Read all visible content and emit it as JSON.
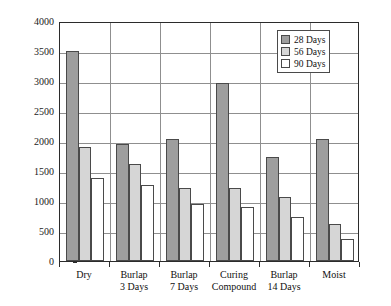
{
  "chart_data": {
    "type": "bar",
    "title": "",
    "xlabel": "",
    "ylabel": "Charge Passed in 6 h (coulomb)",
    "ylim": [
      0,
      4000
    ],
    "ytick_labels": [
      "0",
      "500",
      "1000",
      "1500",
      "2000",
      "2500",
      "3000",
      "3500",
      "4000"
    ],
    "ytick_values": [
      0,
      500,
      1000,
      1500,
      2000,
      2500,
      3000,
      3500,
      4000
    ],
    "grid": "horizontal-and-vertical",
    "legend_position": "top-right",
    "categories": [
      "Dry",
      "Burlap\n3 Days",
      "Burlap\n7 Days",
      "Curing\nCompound",
      "Burlap\n14 Days",
      "Moist"
    ],
    "series": [
      {
        "name": "28 Days",
        "color": "#9e9e9e",
        "values": [
          3500,
          1950,
          2030,
          2970,
          1740,
          2030
        ]
      },
      {
        "name": "56 Days",
        "color": "#d6d6d6",
        "values": [
          1900,
          1620,
          1220,
          1220,
          1060,
          620
        ]
      },
      {
        "name": "90 Days",
        "color": "#ffffff",
        "values": [
          1380,
          1260,
          950,
          900,
          730,
          370
        ]
      }
    ]
  }
}
